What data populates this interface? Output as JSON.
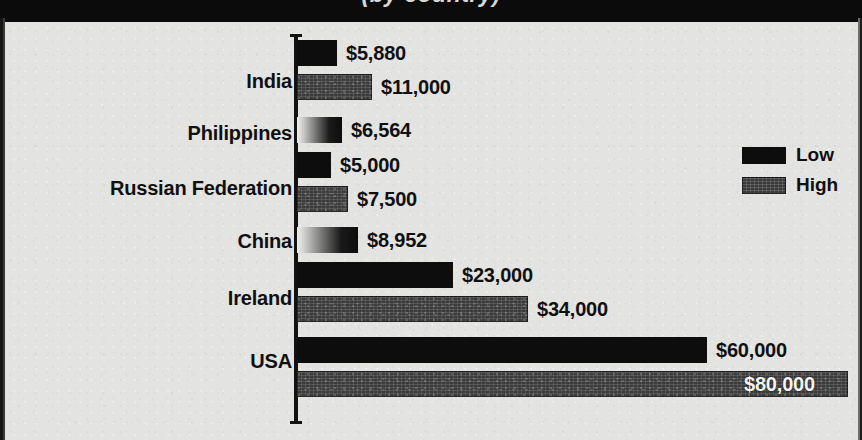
{
  "title": {
    "text_clipped": "(by country)"
  },
  "legend": {
    "position": "right",
    "entries": [
      {
        "label": "Low",
        "swatch": "solid-black-swatch"
      },
      {
        "label": "High",
        "swatch": "dark-grey-textured-swatch"
      }
    ]
  },
  "colors": {
    "background": "#e3e3e1",
    "low_series": "#0d0d0d",
    "high_series": "#3b3b3b",
    "text": "#101010",
    "inside_label_text": "#f4f4f2",
    "axis": "#121212"
  },
  "chart_data": {
    "type": "bar",
    "orientation": "horizontal",
    "title": "(by country)",
    "xlabel": "",
    "ylabel": "",
    "grid": false,
    "legend_position": "right",
    "xlim": [
      0,
      82000
    ],
    "value_prefix": "$",
    "categories": [
      "India",
      "Philippines",
      "Russian Federation",
      "China",
      "Ireland",
      "USA"
    ],
    "series": [
      {
        "name": "Low",
        "values": [
          5880,
          6564,
          5000,
          8952,
          23000,
          60000
        ]
      },
      {
        "name": "High",
        "values": [
          11000,
          null,
          7500,
          null,
          34000,
          80000
        ]
      }
    ],
    "rows": [
      {
        "category": "India",
        "label_top": 48,
        "bars": [
          {
            "series": "Low",
            "value": 5880,
            "value_label": "$5,880",
            "top": 18,
            "width": 40,
            "style": "low",
            "label_inside": false
          },
          {
            "series": "High",
            "value": 11000,
            "value_label": "$11,000",
            "top": 52,
            "width": 75,
            "style": "high",
            "label_inside": false
          }
        ]
      },
      {
        "category": "Philippines",
        "label_top": 100,
        "bars": [
          {
            "series": "Low",
            "value": 6564,
            "value_label": "$6,564",
            "top": 95,
            "width": 45,
            "style": "gradient",
            "label_inside": false
          }
        ]
      },
      {
        "category": "Russian Federation",
        "label_top": 155,
        "bars": [
          {
            "series": "Low",
            "value": 5000,
            "value_label": "$5,000",
            "top": 130,
            "width": 34,
            "style": "low",
            "label_inside": false
          },
          {
            "series": "High",
            "value": 7500,
            "value_label": "$7,500",
            "top": 164,
            "width": 51,
            "style": "high",
            "label_inside": false
          }
        ]
      },
      {
        "category": "China",
        "label_top": 208,
        "bars": [
          {
            "series": "Low",
            "value": 8952,
            "value_label": "$8,952",
            "top": 205,
            "width": 61,
            "style": "gradient",
            "label_inside": false
          }
        ]
      },
      {
        "category": "Ireland",
        "label_top": 265,
        "bars": [
          {
            "series": "Low",
            "value": 23000,
            "value_label": "$23,000",
            "top": 240,
            "width": 156,
            "style": "low",
            "label_inside": false
          },
          {
            "series": "High",
            "value": 34000,
            "value_label": "$34,000",
            "top": 274,
            "width": 231,
            "style": "high",
            "label_inside": false
          }
        ]
      },
      {
        "category": "USA",
        "label_top": 328,
        "bars": [
          {
            "series": "Low",
            "value": 60000,
            "value_label": "$60,000",
            "top": 315,
            "width": 410,
            "style": "low",
            "label_inside": false
          },
          {
            "series": "High",
            "value": 80000,
            "value_label": "$80,000",
            "top": 349,
            "width": 551,
            "style": "high",
            "label_inside": true
          }
        ]
      }
    ]
  }
}
